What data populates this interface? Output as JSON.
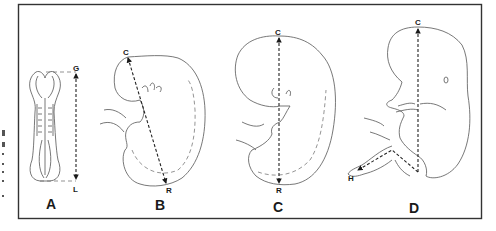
{
  "figure": {
    "panels": [
      {
        "id": "A",
        "label": "A",
        "measure": "greatest length",
        "points": {
          "start": "G",
          "end": "L"
        }
      },
      {
        "id": "B",
        "label": "B",
        "measure": "crown-rump",
        "points": {
          "start": "C",
          "end": "R"
        }
      },
      {
        "id": "C",
        "label": "C",
        "measure": "crown-rump",
        "points": {
          "start": "C",
          "end": "R"
        }
      },
      {
        "id": "D",
        "label": "D",
        "measure": "crown-heel",
        "points": {
          "start": "C",
          "end": "H"
        }
      }
    ],
    "colors": {
      "ink": "#1a1a1a",
      "outline": "#555555",
      "frame": "#333333",
      "background": "#ffffff"
    }
  }
}
